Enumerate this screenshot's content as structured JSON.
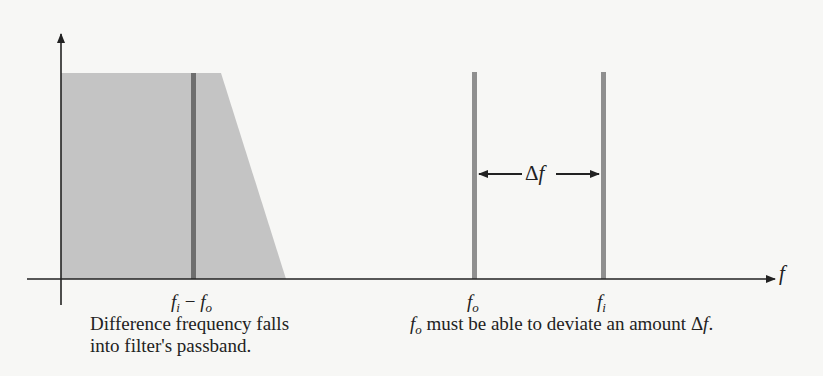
{
  "diagram": {
    "title": "",
    "axis": {
      "x_label": "f"
    },
    "colors": {
      "background": "#f7f7f5",
      "passband_fill": "#c4c4c4",
      "difference_line": "#6e6e6e",
      "signal_line": "#8f8f8f",
      "axis": "#222222"
    },
    "labels": {
      "difference": {
        "base1": "f",
        "sub1": "i",
        "minus": " − ",
        "base2": "f",
        "sub2": "o"
      },
      "fo": {
        "base": "f",
        "sub": "o"
      },
      "fi": {
        "base": "f",
        "sub": "i"
      },
      "delta_f": {
        "delta": "Δ",
        "f": "f"
      }
    },
    "captions": {
      "left_line1": "Difference frequency falls",
      "left_line2": "into filter's passband.",
      "right_prefix_base": "f",
      "right_prefix_sub": "o",
      "right_text": " must be able to deviate an amount ",
      "right_delta": "Δ",
      "right_f": "f",
      "right_end": "."
    }
  }
}
